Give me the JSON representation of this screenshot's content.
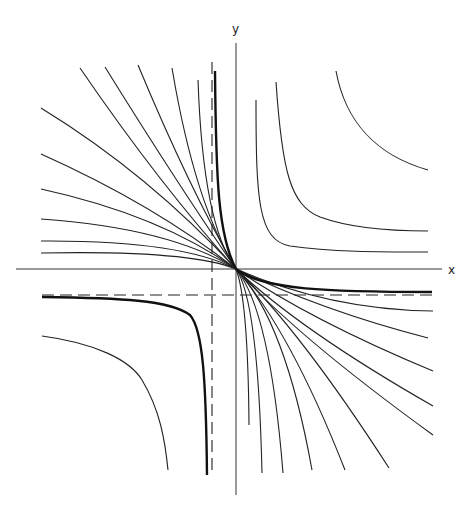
{
  "diagram": {
    "type": "curve family (hyperbolas through a common point with asymptotes)",
    "axes": {
      "x_label": "x",
      "y_label": "y",
      "origin_px": [
        236,
        269
      ]
    },
    "asymptotes": {
      "vertical_dashed_x_px": 212,
      "horizontal_dashed_y_px": 295
    },
    "colors": {
      "stroke": "#222222",
      "background": "#ffffff"
    },
    "curves": {
      "upper_left_fan_count": 11,
      "lower_right_fan_count": 11,
      "upper_right_hyperbolas_count": 3,
      "lower_left_branches_count": 2,
      "highlighted_curve": "thick curve with asymptotes shown dashed"
    }
  }
}
